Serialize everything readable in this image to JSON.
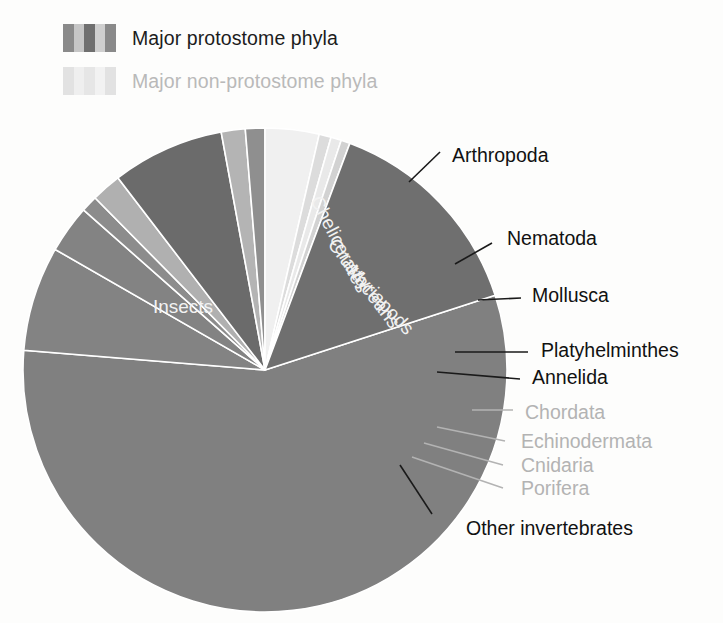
{
  "legend": {
    "items": [
      {
        "label": "Major protostome phyla",
        "style": "dark",
        "swatch_colors": [
          "#8a8a8a",
          "#c6c6c6",
          "#6f6f6f",
          "#cfcfcf",
          "#8a8a8a"
        ]
      },
      {
        "label": "Major non-protostome phyla",
        "style": "light",
        "swatch_colors": [
          "#e2e2e2",
          "#efefef",
          "#e6e6e6",
          "#f2f2f2",
          "#e2e2e2"
        ]
      }
    ]
  },
  "chart_data": {
    "type": "pie",
    "title": "",
    "subtitle": "",
    "xlabel": "",
    "ylabel": "",
    "legend_position": "top-left",
    "grid": false,
    "units": "percent of described animal species",
    "center": {
      "x": 265,
      "y": 370
    },
    "radius": 242,
    "start_angle_deg": -18,
    "direction": "counterclockwise",
    "categories": [
      "Insects",
      "Chelicerates",
      "Crustaceans",
      "Myriapods",
      "Nematoda",
      "Mollusca",
      "Platyhelminthes",
      "Annelida",
      "Chordata",
      "Echinodermata",
      "Cnidaria",
      "Porifera",
      "Other invertebrates"
    ],
    "values": [
      56.3,
      7.0,
      3.2,
      1.1,
      2.0,
      7.5,
      1.6,
      1.3,
      3.6,
      0.8,
      0.7,
      0.6,
      14.3
    ],
    "slices": [
      {
        "label": "Insects",
        "value": 56.3,
        "color": "#808080",
        "label_kind": "inside",
        "group": "protostome"
      },
      {
        "label": "Chelicerates",
        "value": 7.0,
        "color": "#838383",
        "label_kind": "radial",
        "group": "protostome"
      },
      {
        "label": "Crustaceans",
        "value": 3.2,
        "color": "#838383",
        "label_kind": "radial",
        "group": "protostome"
      },
      {
        "label": "Myriapods",
        "value": 1.1,
        "color": "#8c8c8c",
        "label_kind": "radial",
        "group": "protostome"
      },
      {
        "label": "Nematoda",
        "value": 2.0,
        "color": "#b0b0b0",
        "label_kind": "callout",
        "group": "protostome"
      },
      {
        "label": "Mollusca",
        "value": 7.5,
        "color": "#6b6b6b",
        "label_kind": "callout",
        "group": "protostome"
      },
      {
        "label": "Platyhelminthes",
        "value": 1.6,
        "color": "#b4b4b4",
        "label_kind": "callout",
        "group": "protostome"
      },
      {
        "label": "Annelida",
        "value": 1.3,
        "color": "#8f8f8f",
        "label_kind": "callout",
        "group": "protostome"
      },
      {
        "label": "Chordata",
        "value": 3.6,
        "color": "#f0f0f0",
        "label_kind": "callout",
        "group": "non-protostome"
      },
      {
        "label": "Echinodermata",
        "value": 0.8,
        "color": "#dcdcdc",
        "label_kind": "callout",
        "group": "non-protostome"
      },
      {
        "label": "Cnidaria",
        "value": 0.7,
        "color": "#e9e9e9",
        "label_kind": "callout",
        "group": "non-protostome"
      },
      {
        "label": "Porifera",
        "value": 0.6,
        "color": "#d2d2d2",
        "label_kind": "callout",
        "group": "non-protostome"
      },
      {
        "label": "Other invertebrates",
        "value": 14.3,
        "color": "#6f6f6f",
        "label_kind": "callout",
        "group": "protostome"
      }
    ],
    "group_bracket": {
      "label": "Arthropoda",
      "covers": [
        "Insects",
        "Chelicerates",
        "Crustaceans",
        "Myriapods"
      ]
    },
    "annotations": [
      {
        "text": "Arthropoda",
        "style": "dark",
        "x": 452,
        "y": 157
      },
      {
        "text": "Nematoda",
        "style": "dark",
        "x": 507,
        "y": 240
      },
      {
        "text": "Mollusca",
        "style": "dark",
        "x": 532,
        "y": 297
      },
      {
        "text": "Platyhelminthes",
        "style": "dark",
        "x": 541,
        "y": 352
      },
      {
        "text": "Annelida",
        "style": "dark",
        "x": 532,
        "y": 379
      },
      {
        "text": "Chordata",
        "style": "light",
        "x": 525,
        "y": 414
      },
      {
        "text": "Echinodermata",
        "style": "light",
        "x": 521,
        "y": 443
      },
      {
        "text": "Cnidaria",
        "style": "light",
        "x": 521,
        "y": 467
      },
      {
        "text": "Porifera",
        "style": "light",
        "x": 521,
        "y": 490
      },
      {
        "text": "Other invertebrates",
        "style": "dark",
        "x": 466,
        "y": 530
      }
    ],
    "inside_labels": [
      {
        "text": "Insects",
        "x": 183,
        "y": 313,
        "rotation": 0,
        "fill": "#f2f2f2"
      },
      {
        "text": "Chelicerates",
        "x": 334,
        "y": 247,
        "rotation": 63,
        "fill": "#f2f2f2"
      },
      {
        "text": "Crustaceans",
        "x": 359,
        "y": 287,
        "rotation": 53,
        "fill": "#f2f2f2"
      },
      {
        "text": "Myriapods",
        "x": 376,
        "y": 304,
        "rotation": 47,
        "fill": "#efefef"
      }
    ],
    "leaders": [
      {
        "style": "dark",
        "points": "409,182 440,152"
      },
      {
        "style": "dark",
        "points": "455,264 492,243"
      },
      {
        "style": "dark",
        "points": "478,300 521,298"
      },
      {
        "style": "dark",
        "points": "455,352 528,352"
      },
      {
        "style": "dark",
        "points": "437,372 520,379"
      },
      {
        "style": "light",
        "points": "472,410 513,410"
      },
      {
        "style": "light",
        "points": "437,427 505,441"
      },
      {
        "style": "light",
        "points": "424,443 503,465"
      },
      {
        "style": "light",
        "points": "412,457 503,488"
      },
      {
        "style": "dark",
        "points": "400,465 432,514"
      }
    ]
  }
}
